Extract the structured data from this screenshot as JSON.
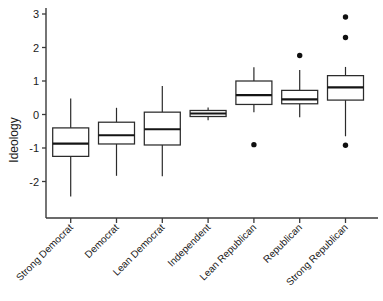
{
  "chart_data": {
    "type": "box",
    "title": "",
    "xlabel": "",
    "ylabel": "Ideology",
    "ylim": [
      -2.6,
      3.2
    ],
    "yticks": [
      3,
      2,
      1,
      0,
      -1,
      -2
    ],
    "ytick_labels": [
      "3",
      "2",
      "1",
      "0",
      "-1",
      "-2"
    ],
    "grid": false,
    "legend": "none",
    "categories": [
      "Strong Democrat",
      "Democrat",
      "Lean Democrat",
      "Independent",
      "Lean Republican",
      "Republican",
      "Strong Republican"
    ],
    "boxes": [
      {
        "category": "Strong Democrat",
        "whisker_low": -2.45,
        "q1": -1.25,
        "median": -0.87,
        "q3": -0.4,
        "whisker_high": 0.48,
        "outliers": []
      },
      {
        "category": "Democrat",
        "whisker_low": -1.83,
        "q1": -0.88,
        "median": -0.62,
        "q3": -0.23,
        "whisker_high": 0.2,
        "outliers": []
      },
      {
        "category": "Lean Democrat",
        "whisker_low": -1.84,
        "q1": -0.91,
        "median": -0.44,
        "q3": 0.07,
        "whisker_high": 0.85,
        "outliers": []
      },
      {
        "category": "Independent",
        "whisker_low": -0.17,
        "q1": -0.06,
        "median": 0.03,
        "q3": 0.12,
        "whisker_high": 0.21,
        "outliers": []
      },
      {
        "category": "Lean Republican",
        "whisker_low": 0.07,
        "q1": 0.3,
        "median": 0.58,
        "q3": 1.0,
        "whisker_high": 1.41,
        "outliers": [
          -0.9
        ]
      },
      {
        "category": "Republican",
        "whisker_low": -0.08,
        "q1": 0.32,
        "median": 0.45,
        "q3": 0.72,
        "whisker_high": 1.33,
        "outliers": [
          1.76
        ]
      },
      {
        "category": "Strong Republican",
        "whisker_low": -0.65,
        "q1": 0.43,
        "median": 0.81,
        "q3": 1.16,
        "whisker_high": 1.42,
        "outliers": [
          2.91,
          2.3,
          -0.92
        ]
      }
    ]
  },
  "axis": {
    "y_title": "Ideology"
  },
  "caption": {
    "text": ""
  }
}
